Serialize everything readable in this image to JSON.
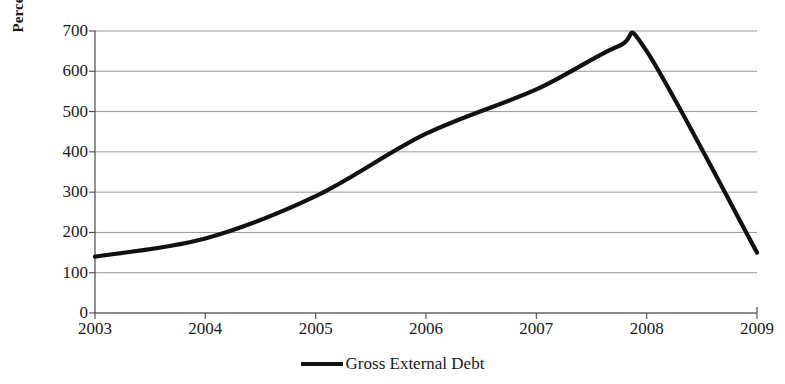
{
  "chart_data": {
    "type": "line",
    "title": "",
    "xlabel": "",
    "ylabel": "Percentage Change",
    "categories": [
      "2003",
      "2004",
      "2005",
      "2006",
      "2007",
      "2008",
      "2009"
    ],
    "x": [
      2003,
      2004,
      2005,
      2006,
      2007,
      2008,
      2009
    ],
    "series": [
      {
        "name": "Gross External Debt",
        "color": "#111111",
        "values": [
          140,
          185,
          290,
          445,
          555,
          650,
          150
        ]
      }
    ],
    "smoothed_points": [
      {
        "x": 2003.0,
        "y": 140
      },
      {
        "x": 2004.0,
        "y": 185
      },
      {
        "x": 2005.0,
        "y": 290
      },
      {
        "x": 2006.0,
        "y": 445
      },
      {
        "x": 2007.0,
        "y": 555
      },
      {
        "x": 2007.75,
        "y": 663
      },
      {
        "x": 2008.0,
        "y": 650
      },
      {
        "x": 2009.0,
        "y": 150
      }
    ],
    "peak": {
      "x": 2007.75,
      "y": 663
    },
    "ylim": [
      0,
      700
    ],
    "ytick_step": 100,
    "yticks": [
      0,
      100,
      200,
      300,
      400,
      500,
      600,
      700
    ],
    "ytick_labels": [
      "0",
      "100",
      "200",
      "300",
      "400",
      "500",
      "600",
      "700"
    ],
    "xlim": [
      2003,
      2009
    ],
    "grid": "horizontal",
    "legend_position": "bottom-center"
  },
  "legend": {
    "entries": [
      {
        "label": "Gross External Debt",
        "color": "#111111"
      }
    ]
  },
  "colors": {
    "line": "#111111",
    "grid": "#8a8a8a",
    "axis": "#4a4a4a",
    "background": "#ffffff",
    "text": "#1a1a1a"
  }
}
